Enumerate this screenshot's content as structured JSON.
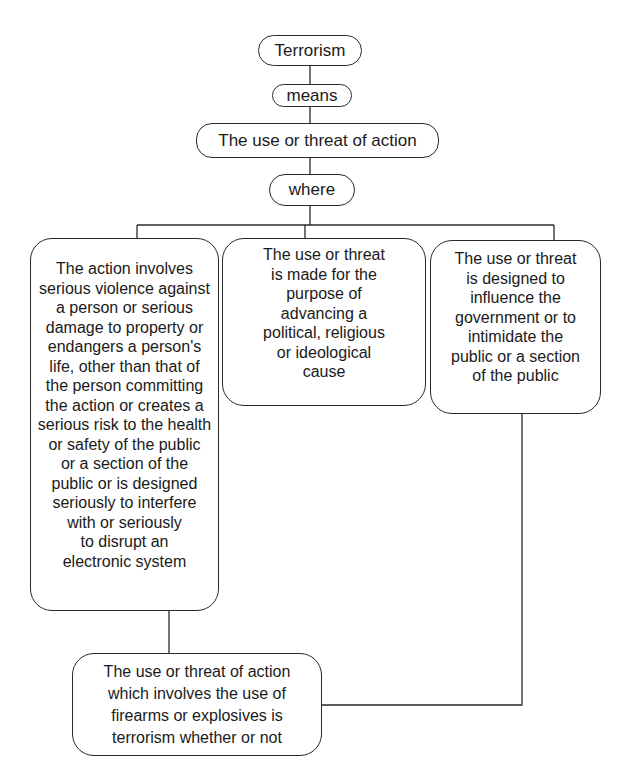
{
  "diagram": {
    "type": "flowchart",
    "root": {
      "label": "Terrorism"
    },
    "connector_1": {
      "label": "means"
    },
    "definition": {
      "label": "The use or threat of action"
    },
    "connector_2": {
      "label": "where"
    },
    "conditions": [
      {
        "label": "The action involves\nserious violence against\na person or serious\ndamage to property or\nendangers a person's\nlife, other than that of\nthe person committing\nthe action or creates a\nserious risk to the health\nor safety of the public\nor a section of the\npublic or is designed\nseriously to interfere\nwith or seriously\nto disrupt an\nelectronic system"
      },
      {
        "label": "The use or threat\nis made for the\npurpose of\nadvancing a\npolitical, religious\nor ideological\ncause"
      },
      {
        "label": "The use or threat\nis designed to\ninfluence the\ngovernment or to\nintimidate the\npublic or a section\nof the public"
      }
    ],
    "exception": {
      "label": "The use or threat of action\nwhich involves the use of\nfirearms or explosives is\nterrorism whether or not"
    },
    "edges": [
      [
        "Terrorism",
        "means"
      ],
      [
        "means",
        "The use or threat of action"
      ],
      [
        "The use or threat of action",
        "where"
      ],
      [
        "where",
        "condition-1"
      ],
      [
        "where",
        "condition-2"
      ],
      [
        "where",
        "condition-3"
      ],
      [
        "condition-1",
        "exception"
      ],
      [
        "condition-3",
        "exception"
      ]
    ]
  },
  "colors": {
    "line": "#2a2a2a",
    "background": "#ffffff",
    "text": "#1a1a1a"
  }
}
